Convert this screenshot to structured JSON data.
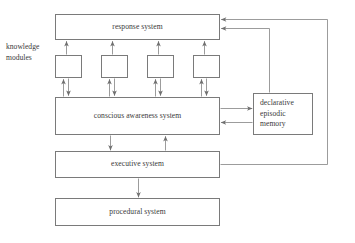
{
  "figure": {
    "type": "block-diagram",
    "canvas": {
      "width": 355,
      "height": 243
    },
    "background_color": "#ffffff",
    "line_color": "#7a7a7a",
    "text_color": "#3a3a3a"
  },
  "nodes": {
    "response_system": {
      "label": "response system",
      "x": 55,
      "y": 14,
      "width": 165,
      "height": 26
    },
    "knowledge_modules_group": {
      "label_line1": "knowledge",
      "label_line2": "modules",
      "label_x": 6,
      "label_y": 42,
      "modules": [
        {
          "name": "knowledge-module-1",
          "label": "",
          "x": 55,
          "y": 55,
          "width": 27,
          "height": 23
        },
        {
          "name": "knowledge-module-2",
          "label": "",
          "x": 101,
          "y": 55,
          "width": 27,
          "height": 23
        },
        {
          "name": "knowledge-module-3",
          "label": "",
          "x": 147,
          "y": 55,
          "width": 27,
          "height": 23
        },
        {
          "name": "knowledge-module-4",
          "label": "",
          "x": 193,
          "y": 55,
          "width": 27,
          "height": 23
        }
      ]
    },
    "conscious_awareness_system": {
      "label": "conscious awareness system",
      "x": 55,
      "y": 97,
      "width": 165,
      "height": 38
    },
    "declarative_episodic_memory": {
      "label_line1": "declarative",
      "label_line2": "episodic",
      "label_line3": "memory",
      "x": 253,
      "y": 93,
      "width": 60,
      "height": 42
    },
    "executive_system": {
      "label": "executive system",
      "x": 55,
      "y": 151,
      "width": 165,
      "height": 27
    },
    "procedural_system": {
      "label": "procedural system",
      "x": 55,
      "y": 198,
      "width": 165,
      "height": 28
    }
  },
  "connections": [
    {
      "name": "module-1-to-response",
      "from": "knowledge-module-1",
      "to": "response-system",
      "direction": "up"
    },
    {
      "name": "module-2-to-response",
      "from": "knowledge-module-2",
      "to": "response-system",
      "direction": "up"
    },
    {
      "name": "module-3-to-response",
      "from": "knowledge-module-3",
      "to": "response-system",
      "direction": "up"
    },
    {
      "name": "module-4-to-response",
      "from": "knowledge-module-4",
      "to": "response-system",
      "direction": "up"
    },
    {
      "name": "cas-to-module-1",
      "from": "conscious-awareness-system",
      "to": "knowledge-module-1",
      "direction": "up"
    },
    {
      "name": "module-1-to-cas",
      "from": "knowledge-module-1",
      "to": "conscious-awareness-system",
      "direction": "down"
    },
    {
      "name": "cas-to-module-2",
      "from": "conscious-awareness-system",
      "to": "knowledge-module-2",
      "direction": "up"
    },
    {
      "name": "module-2-to-cas",
      "from": "knowledge-module-2",
      "to": "conscious-awareness-system",
      "direction": "down"
    },
    {
      "name": "cas-to-module-3",
      "from": "conscious-awareness-system",
      "to": "knowledge-module-3",
      "direction": "up"
    },
    {
      "name": "module-3-to-cas",
      "from": "knowledge-module-3",
      "to": "conscious-awareness-system",
      "direction": "down"
    },
    {
      "name": "cas-to-module-4",
      "from": "conscious-awareness-system",
      "to": "knowledge-module-4",
      "direction": "up"
    },
    {
      "name": "module-4-to-cas",
      "from": "knowledge-module-4",
      "to": "conscious-awareness-system",
      "direction": "down"
    },
    {
      "name": "cas-to-declarative-memory",
      "from": "conscious-awareness-system",
      "to": "declarative-episodic-memory",
      "direction": "right"
    },
    {
      "name": "declarative-memory-to-cas",
      "from": "declarative-episodic-memory",
      "to": "conscious-awareness-system",
      "direction": "left"
    },
    {
      "name": "declarative-memory-to-response",
      "from": "declarative-episodic-memory",
      "to": "response-system",
      "direction": "up-left"
    },
    {
      "name": "cas-to-executive",
      "from": "conscious-awareness-system",
      "to": "executive-system",
      "direction": "down"
    },
    {
      "name": "executive-to-cas",
      "from": "executive-system",
      "to": "conscious-awareness-system",
      "direction": "up"
    },
    {
      "name": "executive-to-response",
      "from": "executive-system",
      "to": "response-system",
      "direction": "right-up-left"
    },
    {
      "name": "executive-to-procedural",
      "from": "executive-system",
      "to": "procedural-system",
      "direction": "down"
    }
  ]
}
